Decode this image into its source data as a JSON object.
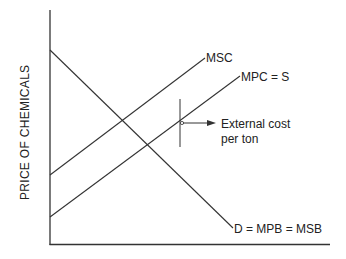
{
  "diagram": {
    "y_axis_label": "PRICE OF CHEMICALS",
    "x_axis_label": "",
    "curves": {
      "msc": {
        "label": "MSC",
        "start": [
          50,
          175
        ],
        "end": [
          205,
          58
        ]
      },
      "mpc": {
        "label": "MPC = S",
        "start": [
          50,
          217
        ],
        "end": [
          240,
          76
        ]
      },
      "demand": {
        "label": "D = MPB = MSB",
        "start": [
          50,
          50
        ],
        "end": [
          233,
          228
        ]
      }
    },
    "annotation": {
      "line1": "External cost",
      "line2": "per ton"
    },
    "colors": {
      "line": "#333333",
      "background": "#ffffff"
    }
  }
}
